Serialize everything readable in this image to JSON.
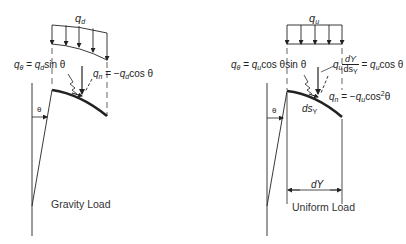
{
  "figure": {
    "panels": [
      {
        "id": "gravity",
        "caption": "Gravity Load",
        "load_label": {
          "symbol": "q",
          "sub": "d"
        },
        "tangential_eq": {
          "lhs_symbol": "q",
          "lhs_sub": "θ",
          "eq": " = ",
          "rhs_symbol": "q",
          "rhs_sub": "d",
          "rhs_tail": "sin θ"
        },
        "normal_eq": {
          "lhs_symbol": "q",
          "lhs_sub": "n",
          "eq": " = −",
          "rhs_symbol": "q",
          "rhs_sub": "d",
          "rhs_tail": "cos θ"
        },
        "angle_label": "θ"
      },
      {
        "id": "uniform",
        "caption": "Uniform Load",
        "load_label": {
          "symbol": "q",
          "sub": "u"
        },
        "tangential_eq": {
          "lhs_symbol": "q",
          "lhs_sub": "θ",
          "eq": " = ",
          "rhs_symbol": "q",
          "rhs_sub": "u",
          "rhs_tail": "cos θsin θ"
        },
        "projected_eq": {
          "symbol": "q",
          "sub": "u",
          "frac_num": "dY",
          "frac_den": "ds",
          "frac_den_sub": "Y",
          "eq": " = ",
          "rhs_symbol": "q",
          "rhs_sub": "u",
          "rhs_tail": "cos θ"
        },
        "normal_eq": {
          "lhs_symbol": "q",
          "lhs_sub": "n",
          "eq": " = −",
          "rhs_symbol": "q",
          "rhs_sub": "u",
          "rhs_tail": "cos",
          "rhs_sup": "2",
          "rhs_end": "θ"
        },
        "segment_label": {
          "text": "ds",
          "sub": "Y"
        },
        "dimension_label": "dY",
        "angle_label": "θ"
      }
    ]
  }
}
